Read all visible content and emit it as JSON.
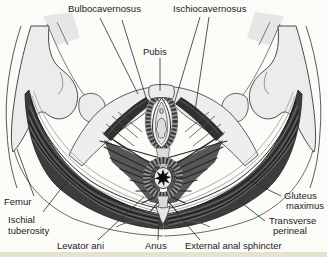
{
  "figure": {
    "type": "anatomical-diagram"
  },
  "labels": {
    "bulbocavernosus": "Bulbocavernosus",
    "ischiocavernosus": "Ischiocavernosus",
    "pubis": "Pubis",
    "femur": "Femur",
    "ischial_line1": "Ischial",
    "ischial_line2": "tuberosity",
    "levator_ani": "Levator ani",
    "anus": "Anus",
    "external_anal_sphincter": "External anal sphincter",
    "transverse_line1": "Transverse",
    "transverse_line2": "perineal",
    "gluteus_line1": "Gluteus",
    "gluteus_line2": "maximus"
  },
  "colors": {
    "background": "#fbfbf8",
    "bottom_band": "#e7e2d0",
    "bone_fill": "#ececec",
    "muscle_dark": "#3c3c3c",
    "outline": "#4a4a4a",
    "label_text": "#1c1c1c"
  }
}
